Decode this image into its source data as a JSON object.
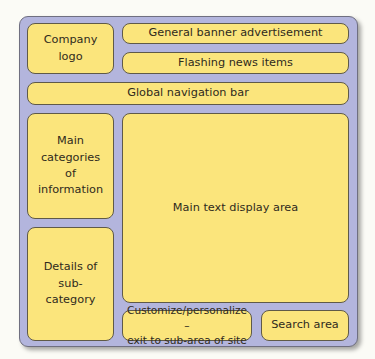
{
  "diagram": {
    "type": "web page layout wireframe",
    "colors": {
      "panel_background": "#b3b5dd",
      "box_fill": "#fbe57c",
      "box_border": "#5f5a48",
      "text": "#2f2a1c"
    },
    "regions": {
      "logo": "Company logo",
      "banner": "General banner advertisement",
      "news": "Flashing news items",
      "nav": "Global navigation bar",
      "categories": "Main categories of information",
      "main_text": "Main text display area",
      "subcategory": "Details of sub-category",
      "customize": "Customize/personalize – exit to sub-area of site",
      "search": "Search area"
    },
    "display_lines": {
      "logo": [
        "Company",
        "logo"
      ],
      "categories": [
        "Main categories",
        "of information"
      ],
      "subcategory": [
        "Details of sub-",
        "category"
      ],
      "customize": [
        "Customize/personalize –",
        "exit to sub-area of site"
      ]
    }
  }
}
